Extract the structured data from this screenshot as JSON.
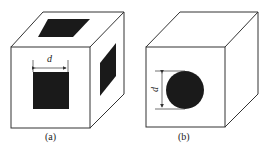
{
  "figure": {
    "panels": [
      {
        "id": "a",
        "caption": "(a)",
        "dimension_label": "d",
        "front_hole": "square",
        "description": "Cube with square openings on front, top and right faces"
      },
      {
        "id": "b",
        "caption": "(b)",
        "dimension_label": "d",
        "front_hole": "circle",
        "description": "Cube with circular opening on front face"
      }
    ],
    "colors": {
      "line": "#333333",
      "fill": "#1a1a1a",
      "background": "#ffffff"
    }
  }
}
